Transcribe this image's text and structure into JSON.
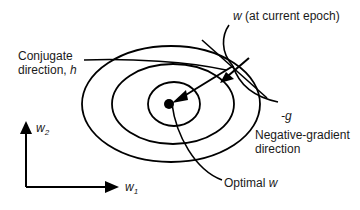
{
  "labels": {
    "current_w": {
      "var": "w",
      "text": " (at current epoch)"
    },
    "conjugate": {
      "line1": "Conjugate",
      "line2": "direction, ",
      "var": "h"
    },
    "neg_g": "-g",
    "neg_gradient": {
      "line1": "Negative-gradient",
      "line2": "direction"
    },
    "optimal": {
      "text": "Optimal ",
      "var": "w"
    },
    "axis_x": {
      "var": "w",
      "sub": "1"
    },
    "axis_y": {
      "var": "w",
      "sub": "2"
    }
  },
  "colors": {
    "stroke": "#000000",
    "background": "#ffffff",
    "text": "#1a1a1a"
  }
}
